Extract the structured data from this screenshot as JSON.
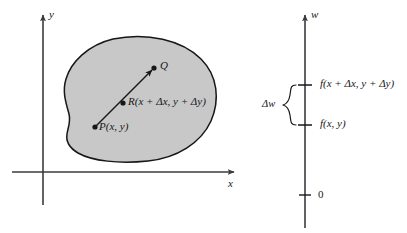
{
  "figure": {
    "type": "math-diagram"
  },
  "colors": {
    "region_fill": "#c8c8c8",
    "stroke": "#17171a",
    "axis": "#3b3b3f",
    "background": "#ffffff"
  },
  "left_panel": {
    "axes": {
      "y_label": "y",
      "x_label": "x"
    },
    "region": {
      "name": "shaded-region",
      "fill": "#c8c8c8"
    },
    "points": [
      {
        "id": "P",
        "label": "P(x, y)",
        "x": 95,
        "y": 127
      },
      {
        "id": "R",
        "label": "R(x + Δx, y + Δy)",
        "x": 123,
        "y": 103
      },
      {
        "id": "Q",
        "label": "Q",
        "x": 154,
        "y": 68
      }
    ],
    "vector": {
      "name": "P-to-Q-arrow",
      "from": "P",
      "to": "Q"
    }
  },
  "right_panel": {
    "axes": {
      "w_label": "w"
    },
    "ticks": [
      {
        "id": "upper",
        "label": "f(x + Δx, y + Δy)",
        "y": 85
      },
      {
        "id": "lower",
        "label": "f(x, y)",
        "y": 125
      },
      {
        "id": "origin",
        "label": "0",
        "y": 195
      }
    ],
    "brace": {
      "label": "Δw",
      "top": 85,
      "bottom": 125
    }
  }
}
